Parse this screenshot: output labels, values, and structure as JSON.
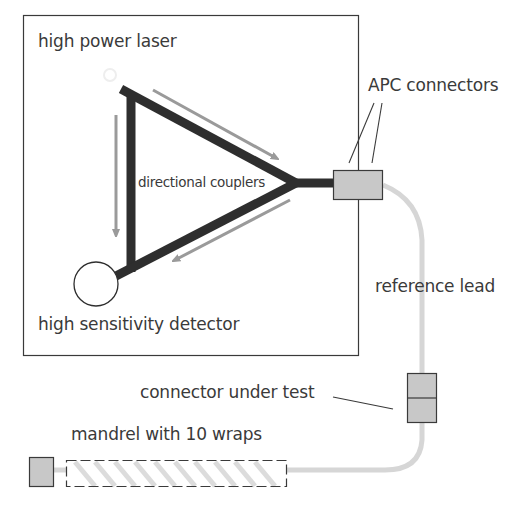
{
  "diagram": {
    "labels": {
      "laser": "high power laser",
      "couplers": "directional couplers",
      "detector": "high sensitivity detector",
      "apc": "APC connectors",
      "reference_lead": "reference lead",
      "connector_under_test": "connector under test",
      "mandrel": "mandrel with 10 wraps"
    },
    "colors": {
      "fiber_dark": "#2e2e2e",
      "arrow": "#9a9a9a",
      "connector_fill": "#c8c8c8",
      "lead": "#d6d6d6",
      "outline": "#3a3a3a",
      "text": "#3a3a3a"
    },
    "components": [
      {
        "id": "enclosure",
        "type": "box"
      },
      {
        "id": "laser",
        "type": "source"
      },
      {
        "id": "coupler",
        "type": "directional-coupler"
      },
      {
        "id": "detector",
        "type": "circle"
      },
      {
        "id": "apc-connector-pair",
        "type": "connector"
      },
      {
        "id": "reference-lead",
        "type": "fiber"
      },
      {
        "id": "connector-under-test",
        "type": "connector"
      },
      {
        "id": "mandrel",
        "type": "mandrel",
        "wraps": 10
      },
      {
        "id": "end-termination",
        "type": "connector"
      }
    ]
  }
}
